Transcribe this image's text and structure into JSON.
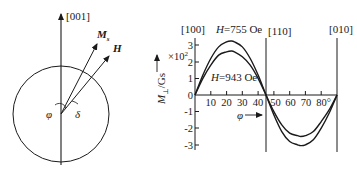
{
  "left_diagram": {
    "axis_label": "[001]",
    "ms_label": "M",
    "ms_sub": "s",
    "h_label": "H",
    "phi_label": "φ",
    "delta_label": "δ"
  },
  "chart_data": {
    "type": "line",
    "title": "",
    "xlabel": "φ",
    "ylabel": "M⊥/Gs",
    "y_multiplier": "×10²",
    "xlim": [
      0,
      90
    ],
    "ylim": [
      -3,
      3
    ],
    "x_ticks": [
      10,
      20,
      30,
      40,
      50,
      60,
      70,
      80
    ],
    "x_tick_labels": [
      "10",
      "20",
      "30",
      "40",
      "50",
      "60",
      "70",
      "80°"
    ],
    "y_ticks": [
      3,
      2,
      1,
      0,
      -1,
      -2,
      -3
    ],
    "y_tick_labels": [
      "3",
      "2",
      "1",
      "0",
      "-1",
      "-2",
      "-3"
    ],
    "direction_labels": [
      {
        "label": "[100]",
        "x": 0
      },
      {
        "label": "[110]",
        "x": 45
      },
      {
        "label": "[010]",
        "x": 90
      }
    ],
    "grid": false,
    "series": [
      {
        "name": "H=755 Oe",
        "x": [
          0,
          5,
          10,
          15,
          20,
          23,
          25,
          30,
          35,
          40,
          45,
          50,
          55,
          60,
          65,
          67,
          70,
          75,
          80,
          85,
          90
        ],
        "values": [
          0,
          1.2,
          2.2,
          2.9,
          3.2,
          3.25,
          3.2,
          2.9,
          2.2,
          1.2,
          0,
          -1.2,
          -2.2,
          -2.8,
          -3.0,
          -3.05,
          -3.0,
          -2.7,
          -2.0,
          -1.1,
          0
        ]
      },
      {
        "name": "H=943 Oe",
        "x": [
          0,
          5,
          10,
          15,
          20,
          23,
          25,
          30,
          35,
          40,
          45,
          50,
          55,
          60,
          65,
          67,
          70,
          75,
          80,
          85,
          90
        ],
        "values": [
          0,
          1.0,
          1.8,
          2.4,
          2.6,
          2.65,
          2.6,
          2.3,
          1.8,
          1.0,
          0,
          -1.0,
          -1.8,
          -2.3,
          -2.45,
          -2.5,
          -2.45,
          -2.2,
          -1.6,
          -0.9,
          0
        ]
      }
    ],
    "annotations": [
      "H=755 Oe",
      "H=943 Oe"
    ]
  },
  "labels": {
    "curve1": "H=755 Oe",
    "curve2": "H=943 Oe",
    "dir_100": "[100]",
    "dir_110": "[110]",
    "dir_010": "[010]",
    "multiplier": "×10",
    "multiplier_exp": "2",
    "ylabel_main": "M",
    "ylabel_sub": "⊥",
    "ylabel_unit": "/Gs",
    "xlabel": "φ"
  }
}
